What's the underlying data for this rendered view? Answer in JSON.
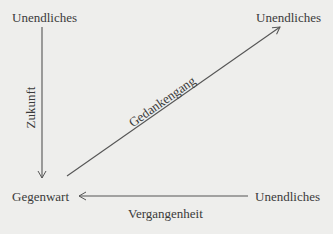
{
  "diagram": {
    "nodes": {
      "top_left": "Unendliches",
      "top_right": "Unendliches",
      "bottom_left": "Gegenwart",
      "bottom_right": "Unendliches"
    },
    "edges": {
      "vertical": "Zukunft",
      "diagonal": "Gedankengang",
      "horizontal": "Vergangenheit"
    },
    "colors": {
      "background": "#eeeeec",
      "ink": "#3a3a3a",
      "line": "#555555"
    }
  }
}
